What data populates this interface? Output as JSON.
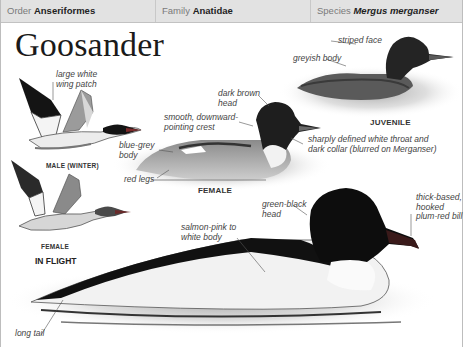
{
  "header": {
    "order_label": "Order",
    "order_value": "Anseriformes",
    "family_label": "Family",
    "family_value": "Anatidae",
    "species_label": "Species",
    "species_value": "Mergus merganser"
  },
  "title": "Goosander",
  "in_flight": {
    "heading": "IN FLIGHT",
    "male_caption": "MALE (WINTER)",
    "female_caption": "FEMALE",
    "male_annotation": [
      "large white",
      "wing patch"
    ]
  },
  "female": {
    "caption": "FEMALE",
    "annotations": {
      "head": [
        "dark brown",
        "head"
      ],
      "crest": [
        "smooth, downward-",
        "pointing crest"
      ],
      "body": [
        "blue-grey",
        "body"
      ],
      "legs": "red legs",
      "throat": [
        "sharply defined white throat and",
        "dark collar (blurred on Merganser)"
      ]
    }
  },
  "juvenile": {
    "caption": "JUVENILE",
    "annotations": {
      "face": "striped face",
      "body": "greyish body"
    }
  },
  "male": {
    "annotations": {
      "head": [
        "green-black",
        "head"
      ],
      "bill": [
        "thick-based,",
        "hooked",
        "plum-red bill"
      ],
      "body": [
        "salmon-pink to",
        "white body"
      ],
      "tail": "long tail"
    }
  },
  "colors": {
    "header_bg": "#e2e2e2",
    "header_label": "#7a7a7a",
    "header_value": "#222222",
    "annotation_text": "#444444"
  }
}
